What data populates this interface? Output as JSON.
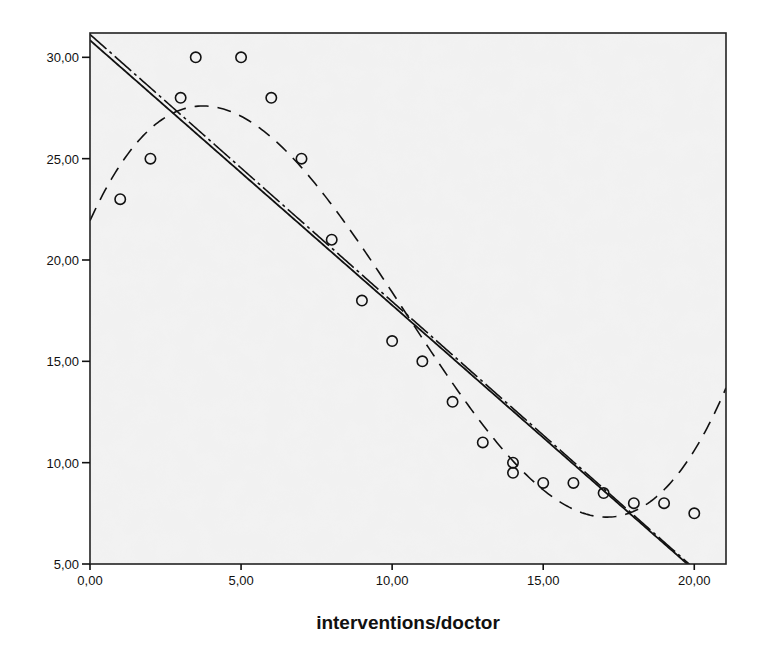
{
  "chart_data": {
    "type": "scatter",
    "title": "",
    "xlabel": "interventions/doctor",
    "ylabel": "",
    "xlim": [
      0,
      21.05
    ],
    "ylim": [
      5,
      31.2
    ],
    "grid": false,
    "legend": null,
    "x_ticks": [
      {
        "value": 0,
        "label": "0,00"
      },
      {
        "value": 5,
        "label": "5,00"
      },
      {
        "value": 10,
        "label": "10,00"
      },
      {
        "value": 15,
        "label": "15,00"
      },
      {
        "value": 20,
        "label": "20,00"
      }
    ],
    "y_ticks": [
      {
        "value": 5,
        "label": "5,00"
      },
      {
        "value": 10,
        "label": "10,00"
      },
      {
        "value": 15,
        "label": "15,00"
      },
      {
        "value": 20,
        "label": "20,00"
      },
      {
        "value": 25,
        "label": "25,00"
      },
      {
        "value": 30,
        "label": "30,00"
      }
    ],
    "series": [
      {
        "name": "observed",
        "kind": "points",
        "marker": "open-circle",
        "points": [
          [
            1,
            23
          ],
          [
            2,
            25
          ],
          [
            3,
            28
          ],
          [
            3.5,
            30
          ],
          [
            5,
            30
          ],
          [
            6,
            28
          ],
          [
            7,
            25
          ],
          [
            8,
            21
          ],
          [
            9,
            18
          ],
          [
            10,
            16
          ],
          [
            11,
            15
          ],
          [
            12,
            13
          ],
          [
            13,
            11
          ],
          [
            14,
            10
          ],
          [
            14,
            9.5
          ],
          [
            15,
            9
          ],
          [
            16,
            9
          ],
          [
            17,
            8.5
          ],
          [
            18,
            8
          ],
          [
            19,
            8
          ],
          [
            20,
            7.5
          ]
        ]
      },
      {
        "name": "linear fit",
        "kind": "line",
        "style": "solid",
        "coefficients": [
          30.84,
          -1.307
        ]
      },
      {
        "name": "quadratic fit",
        "kind": "line",
        "style": "dash-dot",
        "coefficients": [
          31.13,
          -1.318,
          0
        ]
      },
      {
        "name": "cubic fit",
        "kind": "line",
        "style": "dashed",
        "coefficients": [
          21.94,
          3.265,
          -0.532,
          0.01702
        ]
      }
    ]
  },
  "colors": {
    "plot_background": "#f1f1f1",
    "ink": "#111111",
    "page_background": "#ffffff"
  }
}
